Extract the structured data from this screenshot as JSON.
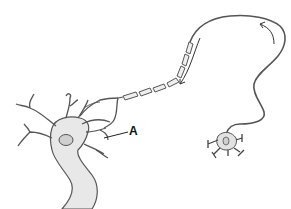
{
  "diagram": {
    "labels": [
      {
        "id": "A",
        "text": "A",
        "x": 131,
        "y": 128
      }
    ],
    "colors": {
      "outline": "#555555",
      "fill": "#e8e8e8",
      "nucleus": "#cfcfcf",
      "myelin": "#efefef",
      "text": "#111111"
    }
  }
}
